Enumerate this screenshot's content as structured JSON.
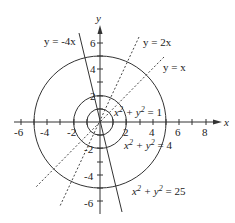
{
  "diagram": {
    "axes": {
      "x_label": "x",
      "y_label": "y",
      "x_ticks": [
        "-6",
        "-4",
        "-2",
        "2",
        "4",
        "6",
        "8"
      ],
      "y_ticks": [
        "6",
        "4",
        "2",
        "-2",
        "-4",
        "-6"
      ]
    },
    "lines": [
      {
        "label": "y = -4x",
        "style": "solid"
      },
      {
        "label": "y = 2x",
        "style": "dashed"
      },
      {
        "label": "y = x",
        "style": "dashed"
      }
    ],
    "circles": [
      {
        "label_base": "x",
        "label_mid": " + y",
        "label_end": " = 1",
        "radius": 1
      },
      {
        "label_base": "x",
        "label_mid": " + y",
        "label_end": " = 4",
        "radius": 2
      },
      {
        "label_base": "x",
        "label_mid": " + y",
        "label_end": " = 25",
        "radius": 5
      }
    ],
    "superscript": "2"
  }
}
